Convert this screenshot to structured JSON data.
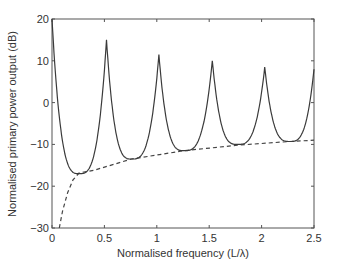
{
  "chart_data": {
    "type": "line",
    "title": "",
    "xlabel": "Normalised frequency (L/λ)",
    "ylabel": "Normalised primary power output (dB)",
    "xlim": [
      0,
      2.5
    ],
    "ylim": [
      -30,
      20
    ],
    "xticks": [
      0,
      0.5,
      1,
      1.5,
      2,
      2.5
    ],
    "xtick_labels": [
      "0",
      "0.5",
      "1",
      "1.5",
      "2",
      "2.5"
    ],
    "yticks": [
      -30,
      -20,
      -10,
      0,
      10,
      20
    ],
    "ytick_labels": [
      "−30",
      "−20",
      "−10",
      "0",
      "10",
      "20"
    ],
    "grid": false,
    "legend": null,
    "series": [
      {
        "name": "primary power output",
        "style": "solid",
        "color": "#444444",
        "peaks": [
          {
            "x": 0.0,
            "y": 20
          },
          {
            "x": 0.52,
            "y": 15
          },
          {
            "x": 1.02,
            "y": 11.5
          },
          {
            "x": 1.53,
            "y": 10
          },
          {
            "x": 2.03,
            "y": 8.5
          }
        ],
        "valleys": [
          {
            "x": 0.26,
            "y": -17
          },
          {
            "x": 0.76,
            "y": -13.5
          },
          {
            "x": 1.26,
            "y": -11.5
          },
          {
            "x": 1.77,
            "y": -10
          },
          {
            "x": 2.27,
            "y": -9.3
          }
        ],
        "end": {
          "x": 2.5,
          "y": 8
        }
      },
      {
        "name": "lower envelope",
        "style": "dashed",
        "color": "#444444",
        "x": [
          0.07,
          0.1,
          0.15,
          0.2,
          0.26,
          0.4,
          0.76,
          1.26,
          1.77,
          2.27,
          2.5
        ],
        "y": [
          -30,
          -26,
          -21.5,
          -18.5,
          -16.8,
          -16.2,
          -13.5,
          -11.5,
          -10.2,
          -9.3,
          -9
        ]
      }
    ]
  }
}
